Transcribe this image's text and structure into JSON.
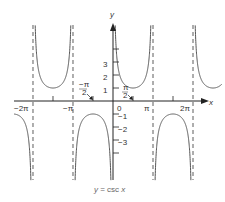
{
  "chart_data": {
    "type": "line",
    "title": "y = csc x",
    "xlabel": "x",
    "ylabel": "y",
    "function": "csc(x)",
    "xlim": [
      -6.9,
      8.8
    ],
    "ylim": [
      -4.5,
      5.5
    ],
    "x_ticks": [
      {
        "value": -6.2832,
        "label": "−2π"
      },
      {
        "value": -4.7124,
        "label": ""
      },
      {
        "value": -3.1416,
        "label": "−π"
      },
      {
        "value": -1.5708,
        "label": "−π/2"
      },
      {
        "value": 0,
        "label": "0"
      },
      {
        "value": 1.5708,
        "label": "π/2"
      },
      {
        "value": 3.1416,
        "label": "π"
      },
      {
        "value": 4.7124,
        "label": ""
      },
      {
        "value": 6.2832,
        "label": "2π"
      }
    ],
    "y_ticks": [
      {
        "value": 1,
        "label": "1"
      },
      {
        "value": 2,
        "label": "2"
      },
      {
        "value": 3,
        "label": "3"
      },
      {
        "value": 4,
        "label": ""
      },
      {
        "value": -1,
        "label": "−1"
      },
      {
        "value": -2,
        "label": "−2"
      },
      {
        "value": -3,
        "label": "−3"
      },
      {
        "value": -4,
        "label": ""
      }
    ],
    "asymptotes": [
      -6.2832,
      -3.1416,
      0,
      3.1416,
      6.2832
    ],
    "annotations": [
      {
        "text": "−π/2",
        "x": -1.5708,
        "y": -1,
        "arrow": true
      },
      {
        "text": "π/2",
        "x": 1.5708,
        "y": 1,
        "arrow": true
      }
    ],
    "grid": false,
    "legend": "none"
  },
  "labels": {
    "y_axis": "y",
    "x_axis": "x",
    "caption_left": "y = csc ",
    "caption_var": "x",
    "origin": "0",
    "neg_2pi": "−2π",
    "neg_pi": "−π",
    "pi": "π",
    "two_pi": "2π",
    "y1": "1",
    "y2": "2",
    "y3": "3",
    "yn1": "−1",
    "yn2": "−2",
    "yn3": "−3",
    "neg_half_pi_num": "−π",
    "neg_half_pi_den": "2",
    "half_pi_num": "π",
    "half_pi_den": "2"
  },
  "colors": {
    "curve": "#555555",
    "axis": "#222222",
    "asymptote": "#333333",
    "text": "#333333"
  }
}
